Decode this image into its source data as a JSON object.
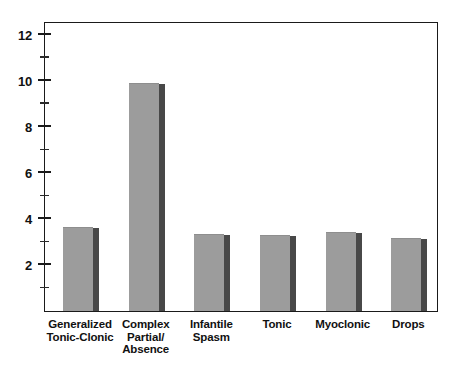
{
  "chart_data": {
    "type": "bar",
    "title": "",
    "subtitle": "",
    "xlabel": "",
    "ylabel": "",
    "categories": [
      "Generalized\nTonic-Clonic",
      "Complex\nPartial/\nAbsence",
      "Infantile\nSpasm",
      "Tonic",
      "Myoclonic",
      "Drops"
    ],
    "category_lines": [
      [
        "Generalized",
        "Tonic-Clonic"
      ],
      [
        "Complex",
        "Partial/",
        "Absence"
      ],
      [
        "Infantile",
        "Spasm"
      ],
      [
        "Tonic"
      ],
      [
        "Myoclonic"
      ],
      [
        "Drops"
      ]
    ],
    "values": [
      3.6,
      9.85,
      3.3,
      3.25,
      3.4,
      3.15
    ],
    "ylim": [
      0,
      12.6
    ],
    "ytick_labels": [
      "2",
      "4",
      "6",
      "8",
      "10",
      "12"
    ],
    "ytick_values": [
      2,
      4,
      6,
      8,
      10,
      12
    ],
    "yminor_values": [
      1,
      3,
      5,
      7,
      9,
      11
    ],
    "grid": false,
    "legend": null,
    "bar_color": "#9c9c9c",
    "bar_shadow_color": "#484848",
    "axis_color": "#1a1a1a",
    "background_color": "#ffffff"
  }
}
